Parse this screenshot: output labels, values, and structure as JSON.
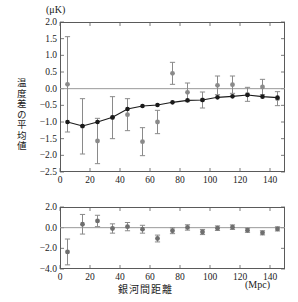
{
  "figure": {
    "top_unit_label": "(μK)",
    "bottom_unit_label": "(Mpc)",
    "y_axis_label": "温度差の平均値",
    "x_axis_label": "銀河間距離",
    "colors": {
      "data_marker": "#8a8a8a",
      "model_marker": "#1a1a1a",
      "model_line": "#1a1a1a",
      "errorbar": "#8a8a8a",
      "zero_line": "#9a9a9a",
      "frame": "#5a5a5a"
    }
  },
  "chart_data": [
    {
      "id": "top-panel",
      "type": "scatter",
      "title": "",
      "xlabel": "",
      "ylabel": "温度差の平均値",
      "yunit": "(μK)",
      "xlim": [
        0,
        150
      ],
      "ylim": [
        -2.5,
        2.0
      ],
      "xticks": [
        0,
        20,
        40,
        60,
        80,
        100,
        120,
        140
      ],
      "yticks": [
        2.0,
        1.5,
        1.0,
        0.5,
        0.0,
        -0.5,
        -1.0,
        -1.5,
        -2.0,
        -2.5
      ],
      "ytick_labels": [
        "2.0",
        "1.5",
        "1.0",
        "0.5",
        "0.0",
        "−0.5",
        "−1.0",
        "−1.5",
        "−2.0",
        "−2.5"
      ],
      "xtick_labels": [
        "0",
        "20",
        "40",
        "60",
        "80",
        "100",
        "120",
        "140"
      ],
      "grid": false,
      "zero_line": true,
      "legend_position": "none",
      "series": [
        {
          "name": "observed",
          "marker": "circle",
          "color": "#8a8a8a",
          "connected": false,
          "x": [
            5,
            15,
            25,
            35,
            45,
            55,
            65,
            75,
            85,
            95,
            105,
            115,
            125,
            135,
            145
          ],
          "y": [
            0.13,
            -1.13,
            -1.57,
            -0.87,
            -0.78,
            -1.59,
            -1.0,
            0.46,
            -0.11,
            -0.34,
            0.1,
            0.12,
            -0.17,
            0.05,
            -0.3
          ],
          "yerr": [
            1.43,
            0.83,
            0.68,
            0.63,
            0.48,
            0.42,
            0.35,
            0.33,
            0.28,
            0.24,
            0.28,
            0.26,
            0.21,
            0.23,
            0.21
          ]
        },
        {
          "name": "model",
          "marker": "circle",
          "color": "#1a1a1a",
          "connected": true,
          "x": [
            5,
            15,
            25,
            35,
            45,
            55,
            65,
            75,
            85,
            95,
            105,
            115,
            125,
            135,
            145
          ],
          "y": [
            -1.0,
            -1.12,
            -1.0,
            -0.86,
            -0.61,
            -0.52,
            -0.49,
            -0.41,
            -0.35,
            -0.34,
            -0.26,
            -0.23,
            -0.19,
            -0.24,
            -0.27
          ]
        }
      ]
    },
    {
      "id": "bottom-panel",
      "type": "scatter",
      "title": "",
      "xlabel": "銀河間距離",
      "ylabel": "",
      "xunit": "(Mpc)",
      "xlim": [
        0,
        150
      ],
      "ylim": [
        -4.0,
        2.0
      ],
      "xticks": [
        0,
        20,
        40,
        60,
        80,
        100,
        120,
        140
      ],
      "yticks": [
        2.0,
        0.0,
        -2.0,
        -4.0
      ],
      "ytick_labels": [
        "2.0",
        "0.0",
        "−2.0",
        "−4.0"
      ],
      "xtick_labels": [
        "0",
        "20",
        "40",
        "60",
        "80",
        "100",
        "120",
        "140"
      ],
      "grid": false,
      "zero_line": true,
      "legend_position": "none",
      "series": [
        {
          "name": "residual",
          "marker": "circle",
          "color": "#6e6e6e",
          "connected": false,
          "x": [
            5,
            15,
            25,
            35,
            45,
            55,
            65,
            75,
            85,
            95,
            105,
            115,
            125,
            135,
            145
          ],
          "y": [
            -2.35,
            0.33,
            0.65,
            -0.08,
            0.1,
            -0.15,
            -1.05,
            -0.3,
            0.02,
            -0.42,
            -0.05,
            0.05,
            -0.25,
            -0.5,
            -0.12
          ],
          "yerr": [
            1.25,
            0.95,
            0.55,
            0.45,
            0.4,
            0.38,
            0.33,
            0.28,
            0.26,
            0.25,
            0.22,
            0.22,
            0.2,
            0.2,
            0.2
          ]
        }
      ]
    }
  ]
}
